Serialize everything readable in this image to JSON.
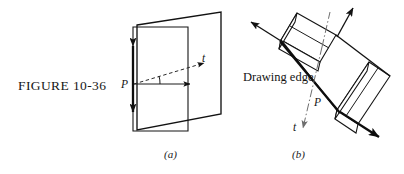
{
  "figure": {
    "number_label": "FIGURE 10-36",
    "panels": [
      {
        "id": "a",
        "sublabel": "(a)",
        "labels": {
          "point": "P",
          "tangent": "t"
        }
      },
      {
        "id": "b",
        "sublabel": "(b)",
        "labels": {
          "point": "P",
          "tangent": "t",
          "drawing_edge": "Drawing edge"
        }
      }
    ],
    "colors": {
      "ink": "#141414",
      "paper": "#ffffff",
      "dashed_ink": "#2a2a2a",
      "centerline_ink": "#6e6e6e"
    }
  }
}
